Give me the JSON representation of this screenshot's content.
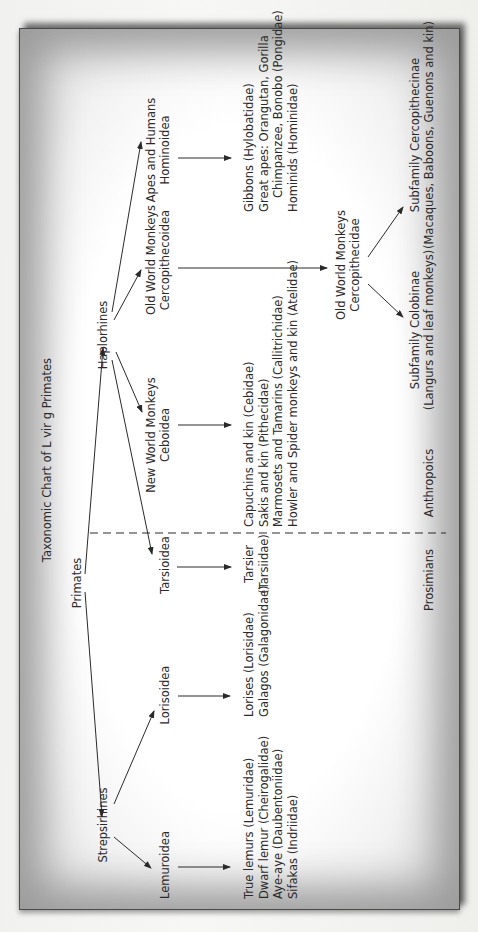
{
  "title": "Taxonomic Chart of L vir g Primates",
  "colors": {
    "ink": "#2a2a2a",
    "frame_border": "#4a4a4a",
    "frame_shade": "#9c9c9c",
    "paper": "#ffffff"
  },
  "orientation": "rotated 90 degrees counter-clockwise",
  "nodes": {
    "primates": "Primates",
    "strepsirhines": "Strepsirhines",
    "haplorhines": "Haplorhines",
    "lemuroidea": "Lemuroidea",
    "lorisoidea": "Lorisoidea",
    "tarsioidea": "Tarsioidea",
    "nwm": {
      "line1": "New World Monkeys",
      "line2": "Ceboidea"
    },
    "owm_super": {
      "line1": "Old World Monkeys",
      "line2": "Cercopithecoidea"
    },
    "apes": {
      "line1": "Apes and Humans",
      "line2": "Hominoidea"
    },
    "owm_family": {
      "line1": "Old World Monkeys",
      "line2": "Cercopithecidae"
    },
    "colobinae": {
      "line1": "Subfamily Colobinae",
      "line2": "(Langurs and leaf monkeys)"
    },
    "cercopithecinae": {
      "line1": "Subfamily Cercopithecinae",
      "line2": "(Macaques, Baboons, Guenons and kin)"
    }
  },
  "lists": {
    "lemurs": [
      "True lemurs (Lemuridae)",
      "Dwarf lemur (Cheirogalidae)",
      "Aye-aye (Daubentoniidae)",
      "Sifakas (Indriidae)"
    ],
    "lorises": [
      "Lorises (Lorisidae)",
      "Galagos (Galagonidae)"
    ],
    "tarsiers": [
      "Tarsier",
      "(Tarsiidae)"
    ],
    "new_world": [
      "Capuchins and kin (Cebidae)",
      "Sakis and kin (Pithecidae)",
      "Marmosets and Tamarins (Callitrichidae)",
      "Howler and Spider monkeys and kin (Atelidae)"
    ],
    "apes": [
      "Gibbons (Hylobatidae)",
      "Great apes: Orangutan, Gorilla",
      "Chimpanzee, Bonobo (Pongidae)",
      "Hominids (Hominidae)"
    ]
  },
  "groups": {
    "left": "Prosimians",
    "right": "Anthropoics"
  }
}
